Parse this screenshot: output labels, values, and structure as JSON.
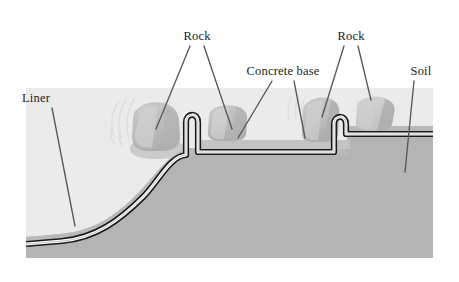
{
  "figure": {
    "type": "technical-cross-section-diagram"
  },
  "palette": {
    "background": "#ffffff",
    "sky_upper_fill": "#ebebeb",
    "soil_fill": "#b4b4b4",
    "soil_fill_light": "#bdbdbd",
    "concrete_fill": "#c8c8c8",
    "rock_fill": "#c0c0c0",
    "rock_fill_dark": "#b0b0b0",
    "rock_fill_light": "#d2d2d2",
    "liner_outline": "#1a1a1a",
    "liner_core": "#ffffff",
    "leader_line": "#57575c",
    "label_text": "#1c1c1c",
    "scuff_mark": "#dcdcdc"
  },
  "labels": [
    {
      "id": "liner",
      "text": "Liner",
      "x": 22,
      "y": 102,
      "anchor": "start"
    },
    {
      "id": "rock_left",
      "text": "Rock",
      "x": 197,
      "y": 40,
      "anchor": "middle"
    },
    {
      "id": "concrete_base",
      "text": "Concrete base",
      "x": 283,
      "y": 75,
      "anchor": "middle"
    },
    {
      "id": "rock_right",
      "text": "Rock",
      "x": 351,
      "y": 40,
      "anchor": "middle"
    },
    {
      "id": "soil",
      "text": "Soil",
      "x": 421,
      "y": 75,
      "anchor": "middle"
    }
  ],
  "leaders": [
    {
      "id": "liner-leader",
      "from_label": "Liner",
      "d": "M 52 108 L 75 226"
    },
    {
      "id": "rock-left-leader-a",
      "from_label": "Rock",
      "d": "M 190 46 L 156 129"
    },
    {
      "id": "rock-left-leader-b",
      "from_label": "Rock",
      "d": "M 204 46 L 232 129"
    },
    {
      "id": "concrete-leader-a",
      "from_label": "Concrete base",
      "d": "M 272 81 L 238 138"
    },
    {
      "id": "concrete-leader-b",
      "from_label": "Concrete base",
      "d": "M 294 81 L 305 138"
    },
    {
      "id": "rock-right-leader-a",
      "from_label": "Rock",
      "d": "M 344 46 L 322 117"
    },
    {
      "id": "rock-right-leader-b",
      "from_label": "Rock",
      "d": "M 358 46 L 371 100"
    },
    {
      "id": "soil-leader",
      "from_label": "Soil",
      "d": "M 414 81 L 405 172"
    }
  ],
  "elements": {
    "upper_ground_band": {
      "name": "upper-light-ground-band",
      "description": "Light grey band above soil level from left edge to right edge"
    },
    "soil_body": {
      "name": "soil-mass",
      "description": "Medium grey soil mass, surface rises from left to right in an S-curve"
    },
    "concrete_base": {
      "name": "concrete-base-slab",
      "description": "Flat concrete platform between the two liner turn-ups"
    },
    "liner": {
      "name": "liner-membrane",
      "description": "Dark-outlined white membrane following soil surface with two inverted-U anchor turn-ups"
    },
    "rocks": [
      {
        "id": "rock-1",
        "name": "rock-1",
        "cx": 156,
        "cy": 128
      },
      {
        "id": "rock-2",
        "name": "rock-2",
        "cx": 228,
        "cy": 118
      },
      {
        "id": "rock-3",
        "name": "rock-3",
        "cx": 322,
        "cy": 115
      },
      {
        "id": "rock-4",
        "name": "rock-4",
        "cx": 375,
        "cy": 112
      }
    ],
    "scuff_marks": {
      "name": "scuff-marks",
      "description": "Faint light arc scratch marks left of rock-1 and left of rock-3"
    }
  }
}
